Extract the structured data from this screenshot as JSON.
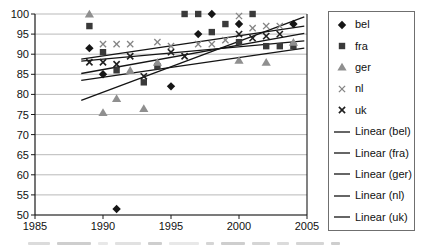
{
  "chart_data": {
    "type": "scatter",
    "title": "",
    "xlabel": "",
    "ylabel": "",
    "x_axis": {
      "min": 1985,
      "max": 2005,
      "ticks": [
        1985,
        1990,
        1995,
        2000,
        2005
      ]
    },
    "y_axis": {
      "min": 50,
      "max": 100,
      "ticks": [
        50,
        55,
        60,
        65,
        70,
        75,
        80,
        85,
        90,
        95,
        100
      ]
    },
    "grid": true,
    "legend_position": "right",
    "series": [
      {
        "name": "bel",
        "marker": "diamond",
        "color": "#161616",
        "points": [
          [
            1989,
            91.5
          ],
          [
            1990,
            85
          ],
          [
            1991,
            51.5
          ],
          [
            1995,
            82
          ],
          [
            1997,
            95
          ],
          [
            1998,
            100
          ],
          [
            2000,
            97.5
          ],
          [
            2004,
            97.5
          ]
        ]
      },
      {
        "name": "fra",
        "marker": "square",
        "color": "#3a3a3a",
        "points": [
          [
            1989,
            97
          ],
          [
            1990,
            90.5
          ],
          [
            1991,
            86
          ],
          [
            1993,
            83
          ],
          [
            1994,
            87
          ],
          [
            1996,
            100
          ],
          [
            1997,
            100
          ],
          [
            1998,
            95.5
          ],
          [
            1999,
            97.5
          ],
          [
            2000,
            93
          ],
          [
            2001,
            100
          ],
          [
            2002,
            92
          ],
          [
            2003,
            92
          ],
          [
            2004,
            92
          ]
        ]
      },
      {
        "name": "ger",
        "marker": "triangle",
        "color": "#8f8f8f",
        "points": [
          [
            1989,
            100
          ],
          [
            1990,
            75.5
          ],
          [
            1991,
            79
          ],
          [
            1992,
            86
          ],
          [
            1993,
            76.5
          ],
          [
            1994,
            88
          ],
          [
            2000,
            88.5
          ],
          [
            2002,
            88
          ],
          [
            2004,
            93
          ]
        ]
      },
      {
        "name": "nl",
        "marker": "x-light",
        "color": "#858585",
        "points": [
          [
            1990,
            92.5
          ],
          [
            1991,
            92.5
          ],
          [
            1992,
            92.5
          ],
          [
            1994,
            93
          ],
          [
            1995,
            92
          ],
          [
            1997,
            92.5
          ],
          [
            1998,
            92.5
          ],
          [
            1999,
            93.5
          ],
          [
            2000,
            99.5
          ],
          [
            2001,
            96.5
          ],
          [
            2002,
            97
          ],
          [
            2003,
            97
          ]
        ]
      },
      {
        "name": "uk",
        "marker": "x-dark",
        "color": "#1f1f1f",
        "points": [
          [
            1989,
            88
          ],
          [
            1990,
            88
          ],
          [
            1991,
            87.5
          ],
          [
            1992,
            89.5
          ],
          [
            1993,
            84.5
          ],
          [
            1995,
            90.5
          ],
          [
            1996,
            89.5
          ],
          [
            2000,
            95
          ],
          [
            2001,
            94
          ],
          [
            2002,
            94.5
          ],
          [
            2003,
            95
          ]
        ]
      }
    ],
    "trend_lines": [
      {
        "name": "Linear (bel)",
        "x1": 1988.4,
        "y1": 78.5,
        "x2": 2004.8,
        "y2": 99.3
      },
      {
        "name": "Linear (fra)",
        "x1": 1988.4,
        "y1": 88.3,
        "x2": 2004.8,
        "y2": 93.3
      },
      {
        "name": "Linear (ger)",
        "x1": 1988.4,
        "y1": 83.5,
        "x2": 2004.8,
        "y2": 91.5
      },
      {
        "name": "Linear (nl)",
        "x1": 1988.4,
        "y1": 88.8,
        "x2": 2004.8,
        "y2": 97.0
      },
      {
        "name": "Linear (uk)",
        "x1": 1988.4,
        "y1": 85.2,
        "x2": 2004.8,
        "y2": 95.2
      }
    ],
    "legend_entries": [
      "bel",
      "fra",
      "ger",
      "nl",
      "uk",
      "Linear (bel)",
      "Linear (fra)",
      "Linear (ger)",
      "Linear (nl)",
      "Linear (uk)"
    ]
  },
  "colors": {
    "background": "#ffffff",
    "gridline": "#b9b9b9",
    "axis": "#1a1a1a",
    "trend_line": "#141414",
    "tick_label": "#111111",
    "legend_border": "#6f6f6f"
  }
}
